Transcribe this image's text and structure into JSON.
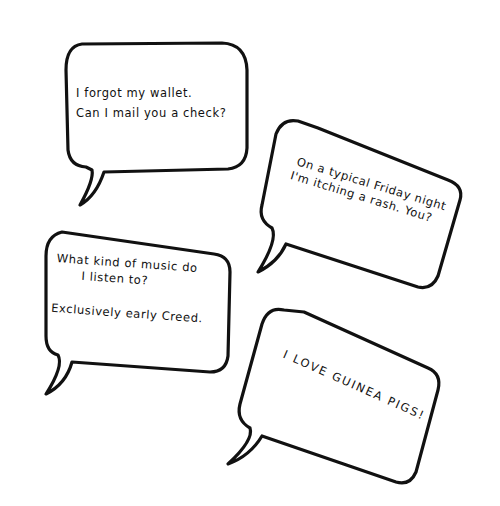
{
  "bubbles": [
    {
      "id": "bubble-1",
      "lines": [
        "I forgot my wallet.",
        "Can I mail you a check?"
      ]
    },
    {
      "id": "bubble-2",
      "lines": [
        "On a typical Friday night",
        "I'm itching a rash. You?"
      ]
    },
    {
      "id": "bubble-3",
      "lines": [
        "What kind of music do",
        "I listen to?",
        "Exclusively early Creed."
      ]
    },
    {
      "id": "bubble-4",
      "lines": [
        "I LOVE GUINEA PIGS!"
      ]
    }
  ],
  "colors": {
    "ink": "#111111",
    "paper": "#ffffff"
  }
}
